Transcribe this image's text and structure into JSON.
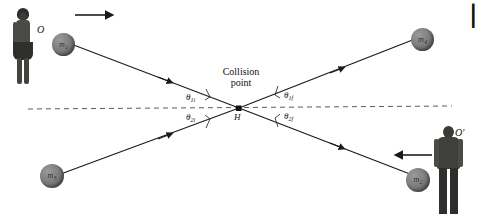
{
  "figure": {
    "type": "physics-collision-diagram",
    "background_color": "#ffffff",
    "line_color": "#1a1a1a",
    "dash_color": "#555555"
  },
  "labels": {
    "collision_point_line1": "Collision",
    "collision_point_line2": "point",
    "collision_vertex": "H",
    "observer_left": "O",
    "observer_right": "O′"
  },
  "masses": [
    {
      "id": "m1",
      "symbol": "m",
      "subscript": "1",
      "position": "upper-left",
      "x": 52,
      "y": 33,
      "d": 23
    },
    {
      "id": "m4",
      "symbol": "m",
      "subscript": "4",
      "position": "upper-right",
      "x": 411,
      "y": 28,
      "d": 23
    },
    {
      "id": "m3",
      "symbol": "m",
      "subscript": "3",
      "position": "lower-left",
      "x": 40,
      "y": 164,
      "d": 24
    },
    {
      "id": "m2",
      "symbol": "m",
      "subscript": "2",
      "position": "lower-right",
      "x": 406,
      "y": 168,
      "d": 24
    }
  ],
  "angles": [
    {
      "id": "theta-1i",
      "symbol": "θ",
      "sub": "1i",
      "side": "left",
      "vertical": "above-axis",
      "x": 186,
      "y": 92
    },
    {
      "id": "theta-2i",
      "symbol": "θ",
      "sub": "2i",
      "side": "left",
      "vertical": "below-axis",
      "x": 186,
      "y": 112
    },
    {
      "id": "theta-1f",
      "symbol": "θ",
      "sub": "1f",
      "side": "right",
      "vertical": "above-axis",
      "x": 284,
      "y": 90
    },
    {
      "id": "theta-2f",
      "symbol": "θ",
      "sub": "2f",
      "side": "right",
      "vertical": "below-axis",
      "x": 284,
      "y": 111
    }
  ],
  "arrows": {
    "top_left_direction": "right",
    "bottom_right_direction": "left",
    "trajectory_arrowheads": 4
  },
  "edge_fragment": {
    "line1": "▌",
    "line2": "▌",
    "line3": "▌"
  }
}
